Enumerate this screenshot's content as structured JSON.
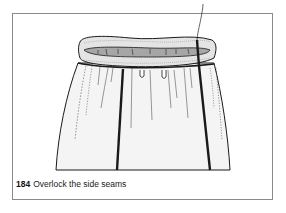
{
  "figure": {
    "number": "184",
    "caption": "Overlock the side seams",
    "illustration": "gathered-skirt-with-elasticated-waistband-and-overlocked-side-seams"
  },
  "colors": {
    "frame_border": "#8a8a8a",
    "line_art": "#1a1a1a",
    "waistband_inner": "#a6a6a6",
    "fabric_fill": "#f4f4f4"
  }
}
